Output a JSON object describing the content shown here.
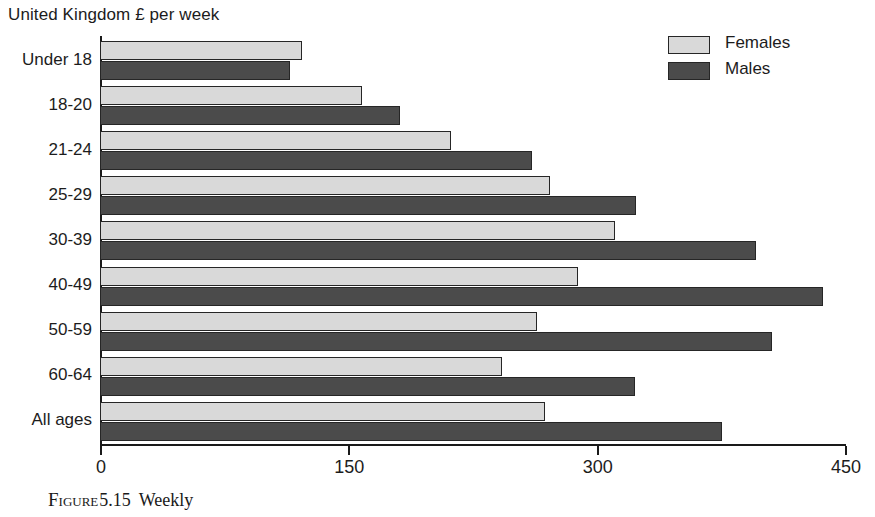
{
  "units_label": "United Kingdom £ per week",
  "legend": {
    "position": "top-right",
    "items": [
      {
        "label": "Females",
        "color": "#d9d9d9",
        "swatch_name": "legend-swatch-females"
      },
      {
        "label": "Males",
        "color": "#4b4b4b",
        "swatch_name": "legend-swatch-males"
      }
    ]
  },
  "caption": {
    "figure_word": "Figure",
    "number": "5.15",
    "rest": "Weekly"
  },
  "chart_data": {
    "type": "bar",
    "orientation": "horizontal",
    "title": "United Kingdom £ per week",
    "xlabel": "",
    "ylabel": "",
    "xlim": [
      0,
      450
    ],
    "xticks": [
      0,
      150,
      300,
      450
    ],
    "xtick_labels": [
      "0",
      "150",
      "300",
      "450"
    ],
    "grid": false,
    "legend_position": "top-right",
    "categories": [
      "Under 18",
      "18-20",
      "21-24",
      "25-29",
      "30-39",
      "40-49",
      "50-59",
      "60-64",
      "All ages"
    ],
    "series": [
      {
        "name": "Females",
        "color": "#d9d9d9",
        "values": [
          122,
          158,
          212,
          272,
          311,
          289,
          264,
          243,
          269
        ]
      },
      {
        "name": "Males",
        "color": "#4b4b4b",
        "values": [
          115,
          181,
          261,
          324,
          396,
          437,
          406,
          323,
          376
        ]
      }
    ]
  }
}
